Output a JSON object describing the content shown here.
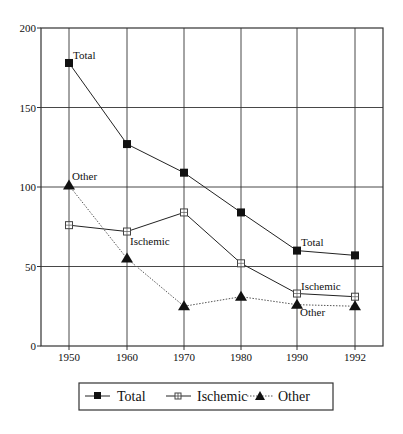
{
  "chart_data": {
    "type": "line",
    "title": "",
    "xlabel": "",
    "ylabel": "",
    "x": [
      "1950",
      "1960",
      "1970",
      "1980",
      "1990",
      "1992"
    ],
    "ylim": [
      0,
      200
    ],
    "yticks": [
      0,
      50,
      100,
      150,
      200
    ],
    "grid": true,
    "legend_position": "bottom",
    "series": [
      {
        "name": "Total",
        "marker": "filled-square",
        "line": "solid",
        "values": [
          178,
          127,
          109,
          84,
          60,
          57
        ]
      },
      {
        "name": "Ischemic",
        "marker": "open-square-cross",
        "line": "solid",
        "values": [
          76,
          72,
          84,
          52,
          33,
          31
        ]
      },
      {
        "name": "Other",
        "marker": "filled-triangle",
        "line": "dotted",
        "values": [
          101,
          55,
          25,
          31,
          26,
          25
        ]
      }
    ],
    "annotations": [
      {
        "text": "Total",
        "x": "1950",
        "series": "Total"
      },
      {
        "text": "Other",
        "x": "1950",
        "series": "Other"
      },
      {
        "text": "Ischemic",
        "x": "1960",
        "series": "Ischemic"
      },
      {
        "text": "Total",
        "x": "1990",
        "series": "Total"
      },
      {
        "text": "Ischemic",
        "x": "1990",
        "series": "Ischemic"
      },
      {
        "text": "Other",
        "x": "1990",
        "series": "Other"
      }
    ]
  },
  "legend": {
    "items": [
      {
        "label": "Total"
      },
      {
        "label": "Ischemic"
      },
      {
        "label": "Other"
      }
    ]
  },
  "colors": {
    "line": "#222222",
    "grid": "#333333",
    "dotted_line": "#555555"
  }
}
